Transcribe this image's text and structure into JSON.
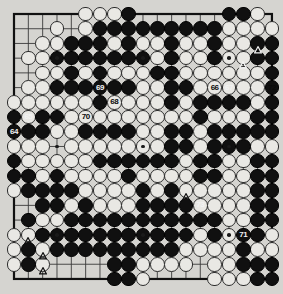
{
  "board": {
    "name": "go-board",
    "size": 19,
    "line_color": "#3a3a3a",
    "board_color": "#d5d4d0",
    "black_color": "#101010",
    "white_color": "#e9e8e4",
    "border_color": "#111111",
    "star_points": [
      [
        3,
        3
      ],
      [
        9,
        3
      ],
      [
        15,
        3
      ],
      [
        3,
        9
      ],
      [
        9,
        9
      ],
      [
        15,
        9
      ],
      [
        3,
        15
      ],
      [
        9,
        15
      ],
      [
        15,
        15
      ]
    ],
    "black_stones": [
      [
        8,
        0
      ],
      [
        15,
        0
      ],
      [
        16,
        0
      ],
      [
        6,
        1
      ],
      [
        7,
        1
      ],
      [
        8,
        1
      ],
      [
        9,
        1
      ],
      [
        10,
        1
      ],
      [
        11,
        1
      ],
      [
        12,
        1
      ],
      [
        13,
        1
      ],
      [
        14,
        1
      ],
      [
        4,
        2
      ],
      [
        5,
        2
      ],
      [
        6,
        2
      ],
      [
        8,
        2
      ],
      [
        11,
        2
      ],
      [
        14,
        2
      ],
      [
        17,
        2
      ],
      [
        18,
        2
      ],
      [
        3,
        3
      ],
      [
        4,
        3
      ],
      [
        5,
        3
      ],
      [
        6,
        3
      ],
      [
        7,
        3
      ],
      [
        8,
        3
      ],
      [
        9,
        3
      ],
      [
        11,
        3
      ],
      [
        14,
        3
      ],
      [
        17,
        3
      ],
      [
        18,
        3
      ],
      [
        4,
        4
      ],
      [
        6,
        4
      ],
      [
        10,
        4
      ],
      [
        11,
        4
      ],
      [
        18,
        4
      ],
      [
        3,
        5
      ],
      [
        4,
        5
      ],
      [
        5,
        5
      ],
      [
        6,
        5
      ],
      [
        7,
        5
      ],
      [
        8,
        5
      ],
      [
        11,
        5
      ],
      [
        12,
        5
      ],
      [
        18,
        5
      ],
      [
        6,
        6
      ],
      [
        11,
        6
      ],
      [
        13,
        6
      ],
      [
        14,
        6
      ],
      [
        15,
        6
      ],
      [
        16,
        6
      ],
      [
        18,
        6
      ],
      [
        0,
        7
      ],
      [
        2,
        7
      ],
      [
        3,
        7
      ],
      [
        13,
        7
      ],
      [
        17,
        7
      ],
      [
        18,
        7
      ],
      [
        0,
        8
      ],
      [
        1,
        8
      ],
      [
        2,
        8
      ],
      [
        5,
        8
      ],
      [
        6,
        8
      ],
      [
        7,
        8
      ],
      [
        8,
        8
      ],
      [
        11,
        8
      ],
      [
        12,
        8
      ],
      [
        14,
        8
      ],
      [
        15,
        8
      ],
      [
        16,
        8
      ],
      [
        17,
        8
      ],
      [
        18,
        8
      ],
      [
        11,
        9
      ],
      [
        12,
        9
      ],
      [
        14,
        9
      ],
      [
        15,
        9
      ],
      [
        16,
        9
      ],
      [
        0,
        10
      ],
      [
        6,
        10
      ],
      [
        7,
        10
      ],
      [
        8,
        10
      ],
      [
        9,
        10
      ],
      [
        10,
        10
      ],
      [
        11,
        10
      ],
      [
        13,
        10
      ],
      [
        14,
        10
      ],
      [
        17,
        10
      ],
      [
        18,
        10
      ],
      [
        0,
        11
      ],
      [
        1,
        11
      ],
      [
        3,
        11
      ],
      [
        8,
        11
      ],
      [
        13,
        11
      ],
      [
        14,
        11
      ],
      [
        17,
        11
      ],
      [
        18,
        11
      ],
      [
        1,
        12
      ],
      [
        2,
        12
      ],
      [
        3,
        12
      ],
      [
        4,
        12
      ],
      [
        9,
        12
      ],
      [
        11,
        12
      ],
      [
        17,
        12
      ],
      [
        18,
        12
      ],
      [
        2,
        13
      ],
      [
        3,
        13
      ],
      [
        5,
        13
      ],
      [
        9,
        13
      ],
      [
        10,
        13
      ],
      [
        11,
        13
      ],
      [
        12,
        13
      ],
      [
        17,
        13
      ],
      [
        18,
        13
      ],
      [
        1,
        14
      ],
      [
        4,
        14
      ],
      [
        5,
        14
      ],
      [
        6,
        14
      ],
      [
        7,
        14
      ],
      [
        8,
        14
      ],
      [
        9,
        14
      ],
      [
        10,
        14
      ],
      [
        11,
        14
      ],
      [
        12,
        14
      ],
      [
        13,
        14
      ],
      [
        14,
        14
      ],
      [
        17,
        14
      ],
      [
        18,
        14
      ],
      [
        2,
        15
      ],
      [
        3,
        15
      ],
      [
        4,
        15
      ],
      [
        5,
        15
      ],
      [
        6,
        15
      ],
      [
        7,
        15
      ],
      [
        8,
        15
      ],
      [
        9,
        15
      ],
      [
        10,
        15
      ],
      [
        11,
        15
      ],
      [
        12,
        15
      ],
      [
        14,
        15
      ],
      [
        16,
        15
      ],
      [
        17,
        15
      ],
      [
        1,
        16
      ],
      [
        3,
        16
      ],
      [
        4,
        16
      ],
      [
        5,
        16
      ],
      [
        6,
        16
      ],
      [
        7,
        16
      ],
      [
        8,
        16
      ],
      [
        9,
        16
      ],
      [
        10,
        16
      ],
      [
        11,
        16
      ],
      [
        16,
        16
      ],
      [
        1,
        17
      ],
      [
        7,
        17
      ],
      [
        8,
        17
      ],
      [
        16,
        17
      ],
      [
        17,
        17
      ],
      [
        18,
        17
      ],
      [
        7,
        18
      ],
      [
        8,
        18
      ],
      [
        17,
        18
      ],
      [
        18,
        18
      ]
    ],
    "white_stones": [
      [
        5,
        0
      ],
      [
        6,
        0
      ],
      [
        7,
        0
      ],
      [
        17,
        0
      ],
      [
        3,
        1
      ],
      [
        5,
        1
      ],
      [
        15,
        1
      ],
      [
        16,
        1
      ],
      [
        17,
        1
      ],
      [
        18,
        1
      ],
      [
        2,
        2
      ],
      [
        3,
        2
      ],
      [
        7,
        2
      ],
      [
        9,
        2
      ],
      [
        10,
        2
      ],
      [
        12,
        2
      ],
      [
        13,
        2
      ],
      [
        15,
        2
      ],
      [
        16,
        2
      ],
      [
        1,
        3
      ],
      [
        2,
        3
      ],
      [
        10,
        3
      ],
      [
        12,
        3
      ],
      [
        13,
        3
      ],
      [
        15,
        3
      ],
      [
        16,
        3
      ],
      [
        2,
        4
      ],
      [
        3,
        4
      ],
      [
        5,
        4
      ],
      [
        7,
        4
      ],
      [
        8,
        4
      ],
      [
        9,
        4
      ],
      [
        12,
        4
      ],
      [
        13,
        4
      ],
      [
        14,
        4
      ],
      [
        15,
        4
      ],
      [
        16,
        4
      ],
      [
        17,
        4
      ],
      [
        1,
        5
      ],
      [
        2,
        5
      ],
      [
        9,
        5
      ],
      [
        10,
        5
      ],
      [
        13,
        5
      ],
      [
        14,
        5
      ],
      [
        15,
        5
      ],
      [
        16,
        5
      ],
      [
        17,
        5
      ],
      [
        0,
        6
      ],
      [
        1,
        6
      ],
      [
        2,
        6
      ],
      [
        3,
        6
      ],
      [
        4,
        6
      ],
      [
        5,
        6
      ],
      [
        7,
        6
      ],
      [
        8,
        6
      ],
      [
        9,
        6
      ],
      [
        10,
        6
      ],
      [
        12,
        6
      ],
      [
        17,
        6
      ],
      [
        1,
        7
      ],
      [
        4,
        7
      ],
      [
        5,
        7
      ],
      [
        6,
        7
      ],
      [
        7,
        7
      ],
      [
        8,
        7
      ],
      [
        9,
        7
      ],
      [
        10,
        7
      ],
      [
        11,
        7
      ],
      [
        12,
        7
      ],
      [
        14,
        7
      ],
      [
        15,
        7
      ],
      [
        16,
        7
      ],
      [
        3,
        8
      ],
      [
        4,
        8
      ],
      [
        9,
        8
      ],
      [
        10,
        8
      ],
      [
        13,
        8
      ],
      [
        0,
        9
      ],
      [
        1,
        9
      ],
      [
        2,
        9
      ],
      [
        4,
        9
      ],
      [
        5,
        9
      ],
      [
        6,
        9
      ],
      [
        7,
        9
      ],
      [
        8,
        9
      ],
      [
        9,
        9
      ],
      [
        10,
        9
      ],
      [
        13,
        9
      ],
      [
        17,
        9
      ],
      [
        18,
        9
      ],
      [
        1,
        10
      ],
      [
        2,
        10
      ],
      [
        3,
        10
      ],
      [
        4,
        10
      ],
      [
        5,
        10
      ],
      [
        12,
        10
      ],
      [
        15,
        10
      ],
      [
        16,
        10
      ],
      [
        2,
        11
      ],
      [
        4,
        11
      ],
      [
        5,
        11
      ],
      [
        6,
        11
      ],
      [
        7,
        11
      ],
      [
        9,
        11
      ],
      [
        10,
        11
      ],
      [
        11,
        11
      ],
      [
        12,
        11
      ],
      [
        15,
        11
      ],
      [
        16,
        11
      ],
      [
        0,
        12
      ],
      [
        5,
        12
      ],
      [
        6,
        12
      ],
      [
        7,
        12
      ],
      [
        8,
        12
      ],
      [
        10,
        12
      ],
      [
        12,
        12
      ],
      [
        13,
        12
      ],
      [
        14,
        12
      ],
      [
        15,
        12
      ],
      [
        16,
        12
      ],
      [
        4,
        13
      ],
      [
        6,
        13
      ],
      [
        7,
        13
      ],
      [
        8,
        13
      ],
      [
        13,
        13
      ],
      [
        14,
        13
      ],
      [
        15,
        13
      ],
      [
        16,
        13
      ],
      [
        2,
        14
      ],
      [
        3,
        14
      ],
      [
        15,
        14
      ],
      [
        16,
        14
      ],
      [
        0,
        15
      ],
      [
        1,
        15
      ],
      [
        13,
        15
      ],
      [
        15,
        15
      ],
      [
        18,
        15
      ],
      [
        0,
        16
      ],
      [
        2,
        16
      ],
      [
        12,
        16
      ],
      [
        13,
        16
      ],
      [
        14,
        16
      ],
      [
        15,
        16
      ],
      [
        17,
        16
      ],
      [
        18,
        16
      ],
      [
        0,
        17
      ],
      [
        2,
        17
      ],
      [
        9,
        17
      ],
      [
        10,
        17
      ],
      [
        11,
        17
      ],
      [
        12,
        17
      ],
      [
        14,
        17
      ],
      [
        15,
        17
      ],
      [
        9,
        18
      ],
      [
        14,
        18
      ],
      [
        15,
        18
      ],
      [
        16,
        18
      ]
    ],
    "move_labels": [
      {
        "text": "64",
        "col": 0,
        "row": 8,
        "on": "black"
      },
      {
        "text": "65",
        "col": 1,
        "row": 7,
        "on": "black"
      },
      {
        "text": "66",
        "col": 14,
        "row": 5,
        "on": "white"
      },
      {
        "text": "67",
        "col": 15,
        "row": 5,
        "on": "black"
      },
      {
        "text": "68",
        "col": 7,
        "row": 6,
        "on": "white"
      },
      {
        "text": "69",
        "col": 6,
        "row": 5,
        "on": "black"
      },
      {
        "text": "70",
        "col": 5,
        "row": 7,
        "on": "white"
      },
      {
        "text": "71",
        "col": 16,
        "row": 15,
        "on": "black"
      },
      {
        "text": "72",
        "col": 18,
        "row": 5,
        "on": "white"
      },
      {
        "text": "73",
        "col": 13,
        "row": 13,
        "on": "black"
      }
    ],
    "triangle_marks": [
      {
        "col": 17,
        "row": 2,
        "on": "black"
      },
      {
        "col": 16,
        "row": 3,
        "on": "black"
      },
      {
        "col": 12,
        "row": 12,
        "on": "white"
      },
      {
        "col": 1,
        "row": 15,
        "on": "white"
      },
      {
        "col": 2,
        "row": 16,
        "on": "white"
      },
      {
        "col": 2,
        "row": 17,
        "on": "white"
      }
    ]
  }
}
